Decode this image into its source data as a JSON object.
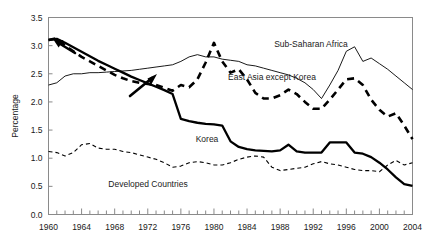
{
  "chart_data": {
    "type": "line",
    "title": "",
    "xlabel": "",
    "ylabel": "Percentage",
    "xlim": [
      1960,
      2004
    ],
    "ylim": [
      0.0,
      3.5
    ],
    "grid": false,
    "legend_position": "inline-annotations",
    "yticks": [
      "0.0",
      "0.5",
      "1.0",
      "1.5",
      "2.0",
      "2.5",
      "3.0",
      "3.5"
    ],
    "ytick_values": [
      0.0,
      0.5,
      1.0,
      1.5,
      2.0,
      2.5,
      3.0,
      3.5
    ],
    "xticks": [
      "1960",
      "1964",
      "1968",
      "1972",
      "1976",
      "1980",
      "1984",
      "1988",
      "1992",
      "1996",
      "2000",
      "2004"
    ],
    "xtick_values": [
      1960,
      1964,
      1968,
      1972,
      1976,
      1980,
      1984,
      1988,
      1992,
      1996,
      2000,
      2004
    ],
    "minor_xtick_step": 1,
    "x": [
      1960,
      1961,
      1962,
      1963,
      1964,
      1965,
      1966,
      1967,
      1968,
      1969,
      1970,
      1971,
      1972,
      1973,
      1974,
      1975,
      1976,
      1977,
      1978,
      1979,
      1980,
      1981,
      1982,
      1983,
      1984,
      1985,
      1986,
      1987,
      1988,
      1989,
      1990,
      1991,
      1992,
      1993,
      1994,
      1995,
      1996,
      1997,
      1998,
      1999,
      2000,
      2001,
      2002,
      2003,
      2004
    ],
    "series": [
      {
        "name": "Korea",
        "style": "thick-solid",
        "color": "#000000",
        "label": "Korea",
        "values": [
          3.1,
          3.12,
          3.05,
          2.97,
          2.89,
          2.81,
          2.73,
          2.66,
          2.59,
          2.52,
          2.45,
          2.39,
          2.33,
          2.27,
          2.21,
          2.14,
          1.7,
          1.66,
          1.63,
          1.61,
          1.6,
          1.58,
          1.3,
          1.2,
          1.16,
          1.14,
          1.13,
          1.12,
          1.14,
          1.24,
          1.12,
          1.1,
          1.1,
          1.1,
          1.28,
          1.28,
          1.28,
          1.1,
          1.08,
          1.02,
          0.92,
          0.8,
          0.66,
          0.54,
          0.51
        ]
      },
      {
        "name": "East Asia except Korea",
        "style": "thick-dashed",
        "color": "#000000",
        "label": "East Asia except Korea",
        "values": [
          3.1,
          3.13,
          3.0,
          2.9,
          2.8,
          2.72,
          2.64,
          2.56,
          2.48,
          2.42,
          2.37,
          2.34,
          2.32,
          2.3,
          2.25,
          2.2,
          2.3,
          2.26,
          2.4,
          2.7,
          3.05,
          2.72,
          2.52,
          2.58,
          2.4,
          2.16,
          2.06,
          2.06,
          2.12,
          2.22,
          2.14,
          2.0,
          1.88,
          1.88,
          2.04,
          2.22,
          2.4,
          2.42,
          2.3,
          2.04,
          1.86,
          1.74,
          1.8,
          1.58,
          1.34
        ]
      },
      {
        "name": "Sub-Saharan Africa",
        "style": "thin-solid",
        "color": "#000000",
        "label": "Sub-Saharan Africa",
        "values": [
          2.3,
          2.34,
          2.46,
          2.5,
          2.5,
          2.52,
          2.52,
          2.53,
          2.54,
          2.55,
          2.56,
          2.58,
          2.6,
          2.62,
          2.64,
          2.66,
          2.72,
          2.8,
          2.84,
          2.8,
          2.8,
          2.76,
          2.74,
          2.72,
          2.66,
          2.64,
          2.6,
          2.56,
          2.52,
          2.48,
          2.42,
          2.34,
          2.22,
          2.06,
          2.3,
          2.56,
          2.9,
          2.98,
          2.72,
          2.78,
          2.68,
          2.58,
          2.46,
          2.34,
          2.22
        ]
      },
      {
        "name": "Developed Countries",
        "style": "thin-dashed",
        "color": "#000000",
        "label": "Developed Countries",
        "values": [
          1.12,
          1.1,
          1.04,
          1.1,
          1.24,
          1.26,
          1.18,
          1.16,
          1.16,
          1.12,
          1.1,
          1.06,
          1.02,
          0.98,
          0.92,
          0.84,
          0.86,
          0.92,
          0.94,
          0.92,
          0.88,
          0.88,
          0.92,
          0.98,
          1.02,
          1.04,
          1.02,
          0.84,
          0.78,
          0.8,
          0.82,
          0.84,
          0.9,
          0.94,
          0.9,
          0.88,
          0.84,
          0.8,
          0.78,
          0.78,
          0.76,
          0.88,
          0.96,
          0.88,
          0.92
        ]
      }
    ],
    "annotations": [
      {
        "name": "korea-arrow",
        "note": "thick arrow pointing up-left to the Korea curve start near 1960"
      },
      {
        "name": "east-asia-arrow",
        "note": "thick arrow pointing up-right toward the Sub-Saharan Africa curve near 1972"
      }
    ]
  },
  "axis": {
    "ylabel": "Percentage"
  },
  "labels": {
    "korea": "Korea",
    "east_asia": "East Asia except Korea",
    "sub_saharan": "Sub-Saharan Africa",
    "developed": "Developed Countries"
  }
}
